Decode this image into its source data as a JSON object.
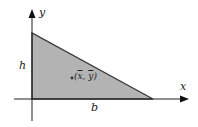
{
  "diagram": {
    "axes": {
      "x_label": "x",
      "y_label": "y"
    },
    "dimensions": {
      "height_label": "h",
      "base_label": "b"
    },
    "centroid": {
      "label_prefix": "(",
      "x_symbol": "x",
      "separator": ", ",
      "y_symbol": "y",
      "label_suffix": ")"
    },
    "colors": {
      "triangle_fill": "#b3b3b3",
      "triangle_edge": "#3a3a3a",
      "axis": "#222222",
      "background": "#ffffff"
    }
  }
}
